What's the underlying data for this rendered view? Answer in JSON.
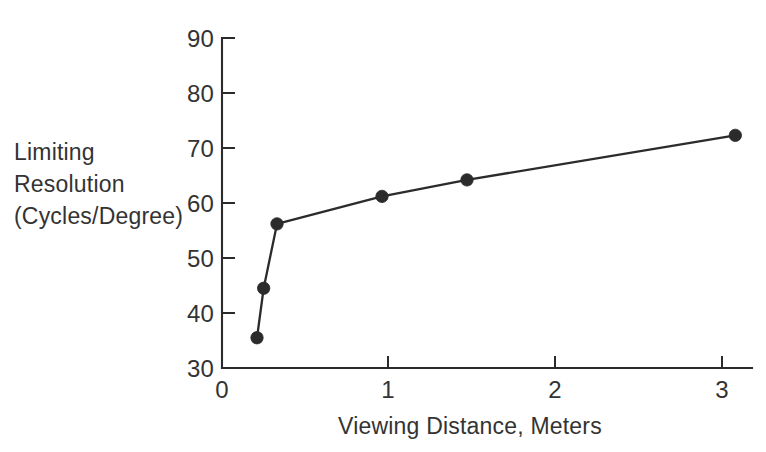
{
  "chart_data": {
    "type": "line",
    "title": "",
    "subtitle": "",
    "xlabel": "Viewing Distance, Meters",
    "ylabel": "Limiting Resolution (Cycles/Degree)",
    "ylabel_lines": [
      "Limiting",
      "Resolution",
      "(Cycles/Degree)"
    ],
    "xlim": [
      0,
      3.18
    ],
    "ylim": [
      30,
      90
    ],
    "xticks": [
      0,
      1,
      2,
      3
    ],
    "xtick_labels": [
      "0",
      "1",
      "2",
      "3"
    ],
    "yticks": [
      30,
      40,
      50,
      60,
      70,
      80,
      90
    ],
    "ytick_labels": [
      "30",
      "40",
      "50",
      "60",
      "70",
      "80",
      "90"
    ],
    "grid": false,
    "legend": null,
    "legend_position": "none",
    "marker": "filled-circle",
    "series": [
      {
        "name": "Limiting Resolution",
        "x": [
          0.21,
          0.25,
          0.33,
          0.96,
          1.47,
          3.08
        ],
        "values": [
          35.5,
          44.5,
          56.2,
          61.2,
          64.2,
          72.3
        ]
      }
    ],
    "annotations": []
  },
  "style": {
    "ink_color": "#2b2b2b",
    "text_color": "#333333",
    "background_color": "#ffffff"
  }
}
